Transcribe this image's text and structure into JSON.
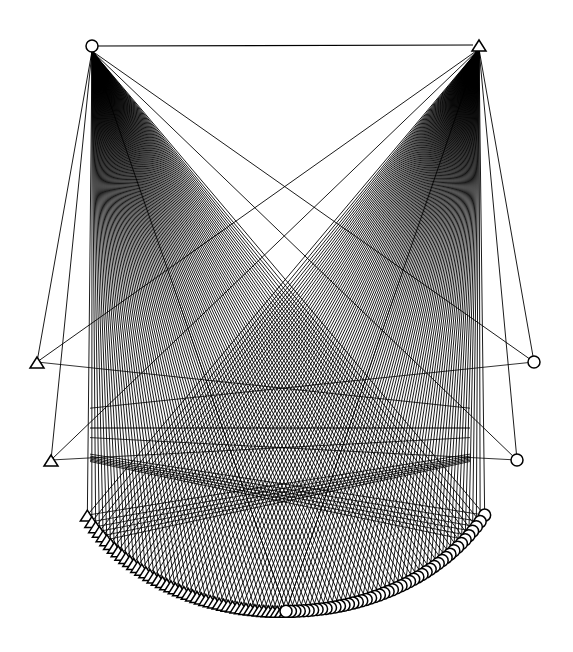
{
  "diagram": {
    "type": "bipartite-network",
    "background": "#ffffff",
    "stroke_color": "#000000",
    "hubs": [
      {
        "id": "hub-left",
        "shape": "circle",
        "x": 92,
        "y": 46
      },
      {
        "id": "hub-right",
        "shape": "triangle",
        "x": 479,
        "y": 45
      }
    ],
    "hub_edge": {
      "from": "hub-left",
      "to": "hub-right"
    },
    "left_outliers": [
      {
        "shape": "triangle",
        "x": 37,
        "y": 362
      },
      {
        "shape": "triangle",
        "x": 51,
        "y": 460
      }
    ],
    "right_outliers": [
      {
        "shape": "circle",
        "x": 534,
        "y": 362
      },
      {
        "shape": "circle",
        "x": 517,
        "y": 460
      }
    ],
    "arc": {
      "center_x": 286,
      "center_y": 430,
      "radius_x": 225,
      "radius_y": 185,
      "left_shape": "triangle",
      "right_shape": "circle",
      "node_count_per_side": 48,
      "start_angle_deg": 28,
      "end_angle_deg": 90
    },
    "cross_edges": {
      "y": 428,
      "x_left": 90,
      "x_right": 470
    }
  }
}
